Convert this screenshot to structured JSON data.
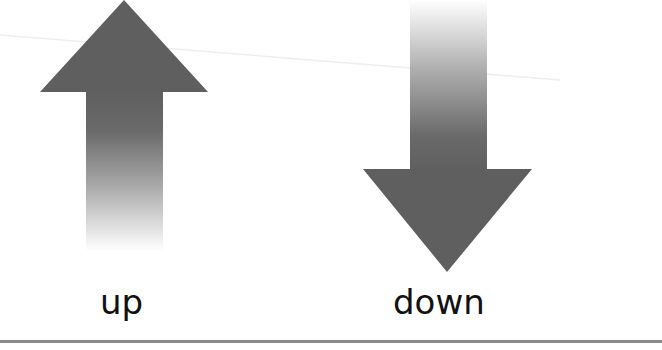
{
  "diagram": {
    "title": "",
    "arrows": [
      {
        "id": "up",
        "direction": "up",
        "label": "up",
        "color": "#5f5f5f",
        "fade_to": "#ffffff"
      },
      {
        "id": "down",
        "direction": "down",
        "label": "down",
        "color": "#5f5f5f",
        "fade_to": "#ffffff"
      }
    ],
    "divider_color": "#8a8a8a",
    "background": "#ffffff"
  }
}
